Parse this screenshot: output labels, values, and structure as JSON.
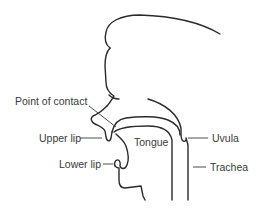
{
  "diagram": {
    "type": "anatomical-cross-section",
    "line_color": "#2a2a2a",
    "text_color": "#3a3a3a",
    "background": "#ffffff",
    "labels": {
      "point_of_contact": "Point of contact",
      "upper_lip": "Upper lip",
      "lower_lip": "Lower lip",
      "tongue": "Tongue",
      "uvula": "Uvula",
      "trachea": "Trachea"
    }
  }
}
